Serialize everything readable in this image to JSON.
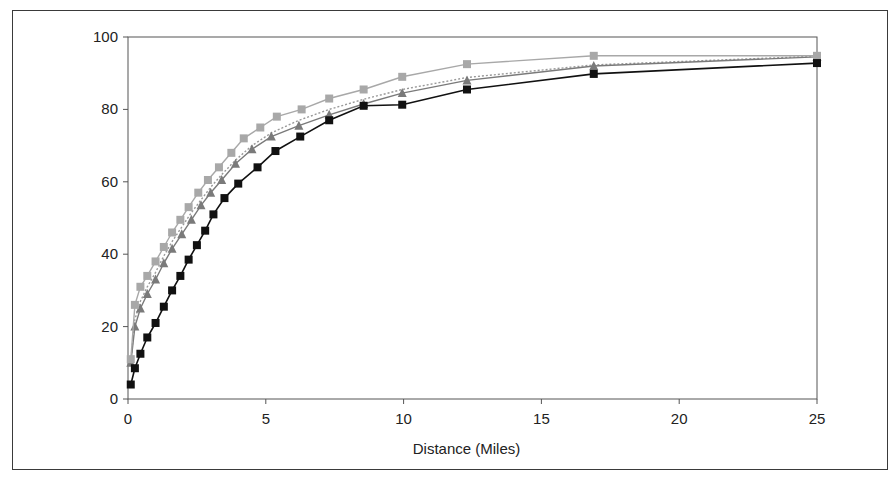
{
  "chart_data": {
    "type": "line",
    "title": "",
    "xlabel": "Distance (Miles)",
    "ylabel": "",
    "xlim": [
      0,
      25
    ],
    "ylim": [
      0,
      100
    ],
    "x_ticks": [
      0,
      5,
      10,
      15,
      20,
      25
    ],
    "y_ticks": [
      0,
      20,
      40,
      60,
      80,
      100
    ],
    "grid": false,
    "legend": null,
    "series": [
      {
        "name": "Series 1 (black squares)",
        "color": "#111111",
        "marker": "square",
        "dash": "",
        "x": [
          0.1,
          0.25,
          0.45,
          0.7,
          1.0,
          1.3,
          1.6,
          1.9,
          2.2,
          2.5,
          2.8,
          3.1,
          3.5,
          4.0,
          4.7,
          5.35,
          6.25,
          7.3,
          8.55,
          9.95,
          12.3,
          16.9,
          25
        ],
        "y": [
          4,
          8.5,
          12.5,
          17,
          21,
          25.5,
          30,
          34,
          38.5,
          42.5,
          46.5,
          51,
          55.5,
          59.5,
          64,
          68.5,
          72.5,
          77,
          81,
          81.3,
          85.5,
          89.8,
          92.8
        ]
      },
      {
        "name": "Series 2 (light gray squares)",
        "color": "#a8a8a8",
        "marker": "square",
        "dash": "",
        "x": [
          0.1,
          0.25,
          0.45,
          0.7,
          1.0,
          1.3,
          1.6,
          1.9,
          2.2,
          2.55,
          2.9,
          3.3,
          3.75,
          4.2,
          4.8,
          5.4,
          6.3,
          7.3,
          8.55,
          9.95,
          12.3,
          16.9,
          25
        ],
        "y": [
          11,
          26,
          31,
          34,
          38,
          42,
          46,
          49.5,
          53,
          57,
          60.5,
          64,
          68,
          72,
          75,
          78,
          80,
          83,
          85.5,
          89,
          92.5,
          94.8,
          94.8
        ]
      },
      {
        "name": "Series 3 (gray triangles)",
        "color": "#7a7a7a",
        "marker": "triangle",
        "dash": "",
        "x": [
          0.1,
          0.25,
          0.45,
          0.7,
          1.0,
          1.3,
          1.6,
          1.95,
          2.3,
          2.65,
          3.0,
          3.4,
          3.9,
          4.5,
          5.2,
          6.2,
          7.3,
          8.55,
          9.95,
          12.3,
          16.9,
          25
        ],
        "y": [
          10,
          20,
          25,
          29,
          33,
          37.5,
          41.5,
          45.5,
          49.5,
          53.5,
          57,
          60.5,
          65,
          69,
          72.5,
          75.5,
          78.5,
          81.5,
          84.5,
          88,
          92,
          94.5
        ]
      },
      {
        "name": "Series 4 (dotted gray)",
        "color": "#999999",
        "marker": "none",
        "dash": "2,2",
        "x": [
          0.1,
          0.25,
          0.45,
          0.7,
          1.0,
          1.3,
          1.6,
          1.95,
          2.3,
          2.65,
          3.0,
          3.4,
          3.9,
          4.5,
          5.2,
          6.2,
          7.3,
          8.55,
          9.95,
          12.3,
          16.9,
          25
        ],
        "y": [
          10.5,
          22,
          27,
          31,
          35,
          39.5,
          43.5,
          47.5,
          51.5,
          55,
          58.5,
          62,
          66,
          70,
          73.5,
          77,
          80,
          82.8,
          85.5,
          88.8,
          92.3,
          94.7
        ]
      }
    ]
  },
  "plot": {
    "left": 128,
    "top": 37,
    "right": 817,
    "bottom": 399
  }
}
